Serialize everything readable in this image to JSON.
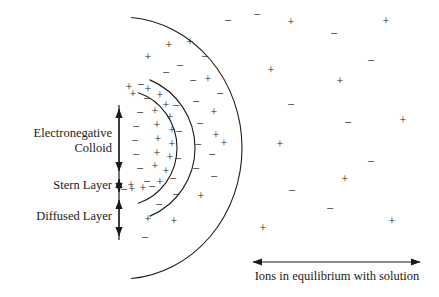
{
  "figure": {
    "width": 439,
    "height": 297,
    "background": "#ffffff",
    "ink_color": "#1a1a1a"
  },
  "labels": {
    "electronegative_colloid": "Electronegative\nColloid",
    "stern_layer": "Stern Layer",
    "diffused_layer": "Diffused Layer",
    "solution_caption": "Ions in equilibrium with solution"
  },
  "bracket_axis": {
    "x": 119,
    "top": 105,
    "bottom": 240,
    "tick_positions": [
      105,
      175,
      196,
      240
    ],
    "segments": [
      {
        "name": "electronegative-colloid",
        "from": 105,
        "to": 175
      },
      {
        "name": "stern-layer",
        "from": 175,
        "to": 196
      },
      {
        "name": "diffused-layer",
        "from": 196,
        "to": 240
      }
    ]
  },
  "solution_arrow": {
    "x1": 253,
    "x2": 420,
    "y": 262,
    "double_headed": true
  },
  "arcs": [
    {
      "name": "colloid-surface-arc",
      "cx": 121,
      "cy": 148,
      "rx": 56,
      "ry": 58,
      "start_deg": -72,
      "end_deg": 72
    },
    {
      "name": "stern-boundary-arc",
      "cx": 121,
      "cy": 148,
      "rx": 74,
      "ry": 74,
      "start_deg": -67,
      "end_deg": 67
    },
    {
      "name": "diffuse-boundary-arc",
      "cx": 121,
      "cy": 148,
      "rx": 121,
      "ry": 131,
      "start_deg": -85,
      "end_deg": 85
    }
  ],
  "ions": {
    "colloid_surface_negatives": [
      {
        "x": 147,
        "y": 100,
        "charge": "-"
      },
      {
        "x": 140,
        "y": 114,
        "charge": "-"
      },
      {
        "x": 136,
        "y": 128,
        "charge": "-"
      },
      {
        "x": 135,
        "y": 142,
        "charge": "-"
      },
      {
        "x": 136,
        "y": 156,
        "charge": "-"
      },
      {
        "x": 140,
        "y": 170,
        "charge": "-"
      },
      {
        "x": 147,
        "y": 183,
        "charge": "-"
      },
      {
        "x": 133,
        "y": 95,
        "charge": "+"
      },
      {
        "x": 132,
        "y": 190,
        "charge": "+"
      }
    ],
    "stern_layer_positives": [
      {
        "x": 160,
        "y": 96,
        "charge": "+"
      },
      {
        "x": 166,
        "y": 106,
        "charge": "+"
      },
      {
        "x": 155,
        "y": 112,
        "charge": "+"
      },
      {
        "x": 170,
        "y": 118,
        "charge": "+"
      },
      {
        "x": 157,
        "y": 126,
        "charge": "+"
      },
      {
        "x": 172,
        "y": 131,
        "charge": "+"
      },
      {
        "x": 158,
        "y": 140,
        "charge": "+"
      },
      {
        "x": 172,
        "y": 145,
        "charge": "+"
      },
      {
        "x": 157,
        "y": 154,
        "charge": "+"
      },
      {
        "x": 170,
        "y": 158,
        "charge": "+"
      },
      {
        "x": 155,
        "y": 167,
        "charge": "+"
      },
      {
        "x": 166,
        "y": 172,
        "charge": "+"
      },
      {
        "x": 160,
        "y": 183,
        "charge": "+"
      },
      {
        "x": 148,
        "y": 90,
        "charge": "+"
      },
      {
        "x": 143,
        "y": 189,
        "charge": "+"
      },
      {
        "x": 131,
        "y": 186,
        "charge": "+"
      },
      {
        "x": 129,
        "y": 88,
        "charge": "+"
      },
      {
        "x": 176,
        "y": 107,
        "charge": "-"
      },
      {
        "x": 179,
        "y": 133,
        "charge": "-"
      },
      {
        "x": 178,
        "y": 160,
        "charge": "-"
      },
      {
        "x": 173,
        "y": 180,
        "charge": "-"
      },
      {
        "x": 141,
        "y": 86,
        "charge": "-"
      },
      {
        "x": 152,
        "y": 188,
        "charge": "-"
      },
      {
        "x": 124,
        "y": 191,
        "charge": "-"
      }
    ],
    "diffuse_layer": [
      {
        "x": 169,
        "y": 46,
        "charge": "+"
      },
      {
        "x": 148,
        "y": 58,
        "charge": "+"
      },
      {
        "x": 190,
        "y": 43,
        "charge": "+"
      },
      {
        "x": 180,
        "y": 67,
        "charge": "-"
      },
      {
        "x": 205,
        "y": 58,
        "charge": "-"
      },
      {
        "x": 166,
        "y": 74,
        "charge": "-"
      },
      {
        "x": 208,
        "y": 80,
        "charge": "+"
      },
      {
        "x": 193,
        "y": 82,
        "charge": "-"
      },
      {
        "x": 220,
        "y": 95,
        "charge": "-"
      },
      {
        "x": 196,
        "y": 103,
        "charge": "-"
      },
      {
        "x": 214,
        "y": 113,
        "charge": "+"
      },
      {
        "x": 200,
        "y": 125,
        "charge": "-"
      },
      {
        "x": 216,
        "y": 136,
        "charge": "+"
      },
      {
        "x": 198,
        "y": 146,
        "charge": "-"
      },
      {
        "x": 212,
        "y": 156,
        "charge": "-"
      },
      {
        "x": 224,
        "y": 144,
        "charge": "+"
      },
      {
        "x": 196,
        "y": 170,
        "charge": "-"
      },
      {
        "x": 214,
        "y": 178,
        "charge": "-"
      },
      {
        "x": 176,
        "y": 196,
        "charge": "-"
      },
      {
        "x": 201,
        "y": 197,
        "charge": "+"
      },
      {
        "x": 159,
        "y": 206,
        "charge": "-"
      },
      {
        "x": 148,
        "y": 220,
        "charge": "+"
      },
      {
        "x": 174,
        "y": 222,
        "charge": "+"
      },
      {
        "x": 145,
        "y": 239,
        "charge": "-"
      },
      {
        "x": 228,
        "y": 22,
        "charge": "-"
      }
    ],
    "bulk_solution": [
      {
        "x": 291,
        "y": 23,
        "charge": "+"
      },
      {
        "x": 334,
        "y": 35,
        "charge": "-"
      },
      {
        "x": 386,
        "y": 22,
        "charge": "+"
      },
      {
        "x": 371,
        "y": 62,
        "charge": "-"
      },
      {
        "x": 271,
        "y": 71,
        "charge": "+"
      },
      {
        "x": 340,
        "y": 82,
        "charge": "+"
      },
      {
        "x": 291,
        "y": 106,
        "charge": "-"
      },
      {
        "x": 348,
        "y": 124,
        "charge": "-"
      },
      {
        "x": 403,
        "y": 121,
        "charge": "+"
      },
      {
        "x": 280,
        "y": 145,
        "charge": "+"
      },
      {
        "x": 371,
        "y": 163,
        "charge": "-"
      },
      {
        "x": 345,
        "y": 180,
        "charge": "+"
      },
      {
        "x": 292,
        "y": 192,
        "charge": "-"
      },
      {
        "x": 330,
        "y": 210,
        "charge": "-"
      },
      {
        "x": 392,
        "y": 222,
        "charge": "+"
      },
      {
        "x": 263,
        "y": 229,
        "charge": "+"
      },
      {
        "x": 257,
        "y": 16,
        "charge": "-"
      }
    ]
  }
}
